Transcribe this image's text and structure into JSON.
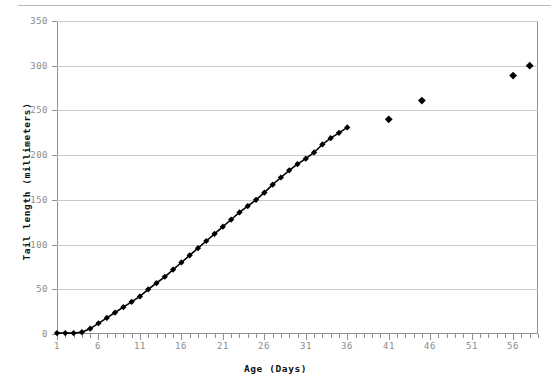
{
  "chart_data": {
    "type": "scatter",
    "title": "",
    "xlabel": "Age  (Days)",
    "ylabel": "Tail length (millimeters)",
    "xlim": [
      1,
      59
    ],
    "ylim": [
      0,
      350
    ],
    "grid": true,
    "legend": null,
    "xticks": [
      1,
      6,
      11,
      16,
      21,
      26,
      31,
      36,
      41,
      46,
      51,
      56
    ],
    "yticks": [
      0,
      50,
      100,
      150,
      200,
      250,
      300,
      350
    ],
    "marker": "diamond",
    "marker_color": "#000000",
    "line_color": "#000000",
    "series": [
      {
        "name": "Tail length",
        "connected": true,
        "x": [
          1,
          2,
          3,
          4,
          5,
          6,
          7,
          8,
          9,
          10,
          11,
          12,
          13,
          14,
          15,
          16,
          17,
          18,
          19,
          20,
          21,
          22,
          23,
          24,
          25,
          26,
          27,
          28,
          29,
          30,
          31,
          32,
          33,
          34,
          35,
          36
        ],
        "values": [
          1,
          1,
          1,
          2,
          6,
          12,
          18,
          24,
          30,
          36,
          42,
          50,
          57,
          64,
          72,
          80,
          88,
          96,
          104,
          112,
          120,
          128,
          136,
          143,
          150,
          158,
          167,
          175,
          183,
          190,
          196,
          203,
          212,
          219,
          225,
          231
        ]
      },
      {
        "name": "Tail length (later measurements)",
        "connected": false,
        "x": [
          41,
          45,
          56,
          58
        ],
        "values": [
          240,
          261,
          289,
          300
        ]
      }
    ]
  },
  "axis": {
    "y_tick_labels": [
      "350",
      "300",
      "250",
      "200",
      "150",
      "100",
      "50",
      "0"
    ],
    "x_tick_labels": [
      "1",
      "6",
      "11",
      "16",
      "21",
      "26",
      "31",
      "36",
      "41",
      "46",
      "51",
      "56"
    ],
    "x_title": "Age  (Days)",
    "y_title": "Tail length (millimeters)"
  },
  "colors": {
    "gridline": "#c9c9c9",
    "frame": "#8f8f8f",
    "tick_text": "#8a8a8a",
    "marker": "#000000",
    "top_rule": "#b9b9b9"
  }
}
